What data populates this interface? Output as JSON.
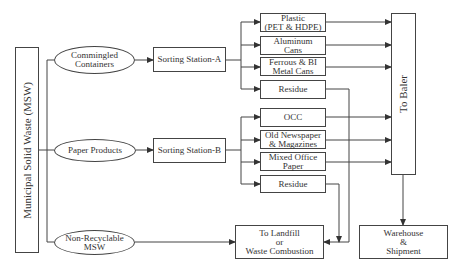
{
  "diagram": {
    "source": {
      "label": "Municipal Solid Waste (MSW)"
    },
    "streams": [
      {
        "id": "commingled",
        "label": "Commingled Containers",
        "line1": "Commingled",
        "line2": "Containers"
      },
      {
        "id": "paper",
        "label": "Paper Products"
      },
      {
        "id": "nonrecyclable",
        "label": "Non-Recyclable MSW",
        "line1": "Non-Recyclable",
        "line2": "MSW"
      }
    ],
    "stations": [
      {
        "id": "sorting-a",
        "label": "Sorting Station-A"
      },
      {
        "id": "sorting-b",
        "label": "Sorting Station-B"
      }
    ],
    "outputs_a": [
      {
        "line1": "Plastic",
        "line2": "(PET & HDPE)"
      },
      {
        "line1": "Aluminum",
        "line2": "Cans"
      },
      {
        "line1": "Ferrous & BI",
        "line2": "Metal Cans"
      },
      {
        "line1": "Residue",
        "line2": ""
      }
    ],
    "outputs_b": [
      {
        "line1": "OCC",
        "line2": ""
      },
      {
        "line1": "Old Newspaper",
        "line2": "& Magazines"
      },
      {
        "line1": "Mixed Office",
        "line2": "Paper"
      },
      {
        "line1": "Residue",
        "line2": ""
      }
    ],
    "baler": {
      "label": "To Baler"
    },
    "landfill": {
      "line1": "To Landfill",
      "line2": "or",
      "line3": "Waste Combustion"
    },
    "warehouse": {
      "line1": "Warehouse",
      "line2": "&",
      "line3": "Shipment"
    },
    "colors": {
      "line": "#444444",
      "text": "#333333",
      "background": "#ffffff"
    }
  }
}
